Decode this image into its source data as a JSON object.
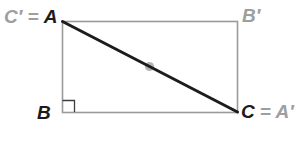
{
  "figure": {
    "shape": "rectangle",
    "colors": {
      "background": "#ffffff",
      "rectangle_outline": "#9a9a9a",
      "diagonal": "#1c1c1c",
      "midpoint_dot": "#b5b5b5",
      "right_angle_marker": "#3c3c3c",
      "label_gray": "#9e9e9e",
      "label_black": "#1c1c1c"
    },
    "vertices": {
      "top_left": {
        "gray_part": "C′ =",
        "black_part": "A"
      },
      "top_right": {
        "gray_part": "B′"
      },
      "bottom_left": {
        "black_part": "B"
      },
      "bottom_right": {
        "black_part": "C",
        "gray_part": "= A′"
      }
    },
    "features": {
      "diagonal_from": "A (top-left)",
      "diagonal_to": "C (bottom-right)",
      "midpoint_marker_on_diagonal": true,
      "right_angle_marker_at": "B (bottom-left)"
    }
  }
}
